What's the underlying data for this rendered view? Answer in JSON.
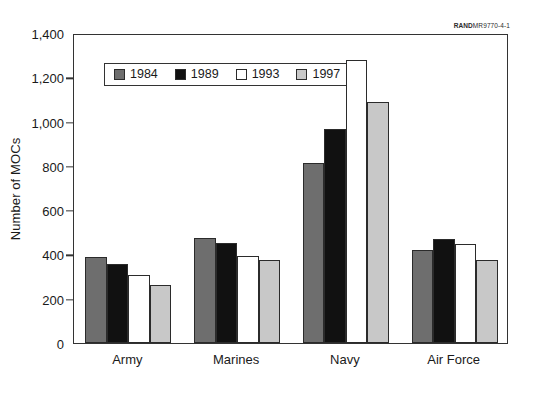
{
  "source_tag": {
    "bold_prefix": "RAND",
    "rest": "MR9770-4-1"
  },
  "chart_data": {
    "type": "bar",
    "title": "",
    "xlabel": "",
    "ylabel": "Number of MOCs",
    "categories": [
      "Army",
      "Marines",
      "Navy",
      "Air Force"
    ],
    "series": [
      {
        "name": "1984",
        "color": "#6e6e6e",
        "values": [
          390,
          475,
          815,
          420
        ]
      },
      {
        "name": "1989",
        "color": "#111111",
        "values": [
          355,
          450,
          965,
          470
        ]
      },
      {
        "name": "1993",
        "color": "#ffffff",
        "values": [
          305,
          395,
          1280,
          445
        ]
      },
      {
        "name": "1997",
        "color": "#c8c8c8",
        "values": [
          260,
          375,
          1090,
          375
        ]
      }
    ],
    "ylim": [
      0,
      1400
    ],
    "yticks": [
      0,
      200,
      400,
      600,
      800,
      1000,
      1200,
      1400
    ],
    "ytick_labels": [
      "0",
      "200",
      "400",
      "600",
      "800",
      "1,000",
      "1,200",
      "1,400"
    ],
    "grid": false,
    "legend_position": "upper-left-inside",
    "bar_edge_color": "#2b2b2b",
    "axis_color": "#333333"
  }
}
